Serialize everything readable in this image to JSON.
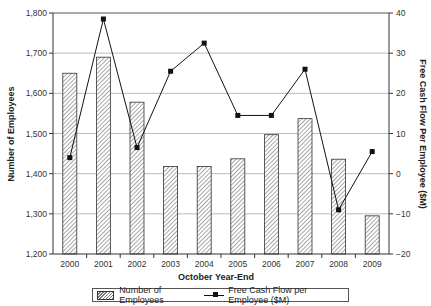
{
  "chart_data": {
    "type": "bar+line",
    "title": "",
    "xlabel": "October Year-End",
    "ylabel": "Number of Employees",
    "y2label": "Free Cash Flow Per Employee ($M)",
    "categories": [
      "2000",
      "2001",
      "2002",
      "2003",
      "2004",
      "2005",
      "2006",
      "2007",
      "2008",
      "2009"
    ],
    "series": [
      {
        "name": "Number of Employees",
        "type": "bar",
        "axis": "left",
        "values": [
          1650,
          1690,
          1578,
          1418,
          1418,
          1437,
          1497,
          1537,
          1436,
          1295
        ]
      },
      {
        "name": "Free Cash Flow per Employee ($M)",
        "type": "line",
        "axis": "right",
        "values": [
          4,
          38.5,
          6.5,
          25.5,
          32.5,
          14.5,
          14.5,
          26,
          -9,
          5.5
        ]
      }
    ],
    "ylim": [
      1200,
      1800
    ],
    "y2lim": [
      -20,
      40
    ],
    "yticks": [
      "1,200",
      "1,300",
      "1,400",
      "1,500",
      "1,600",
      "1,700",
      "1,800"
    ],
    "y2ticks": [
      "-20",
      "-10",
      "0",
      "10",
      "20",
      "30",
      "40"
    ],
    "grid": true,
    "legend_position": "bottom"
  },
  "legend": {
    "bar_label": "Number of Employees",
    "line_label": "Free Cash Flow per Employee ($M)"
  }
}
